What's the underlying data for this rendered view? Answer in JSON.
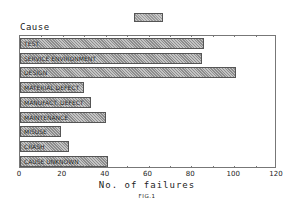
{
  "chart_data": {
    "type": "bar",
    "orientation": "horizontal",
    "title": "",
    "ylabel": "Cause",
    "xlabel": "No. of failures",
    "caption": "FIG.1",
    "xlim": [
      0,
      120
    ],
    "xticks": [
      0,
      20,
      40,
      60,
      80,
      100,
      120
    ],
    "grid": false,
    "legend": {
      "position": "top-center",
      "entries": [
        ""
      ]
    },
    "categories": [
      "TEST",
      "SERVICE ENVIRONMENT",
      "DESIGN",
      "MATERIAL DEFECT",
      "MANUFACT. DEFECT",
      "MAINTENANCE",
      "MISUSE",
      "CRASH",
      "CAUSE UNKNOWN"
    ],
    "values": [
      86,
      85,
      101,
      30,
      33,
      40,
      19,
      23,
      41
    ]
  },
  "labels": {
    "cause": "Cause",
    "xlabel": "No. of failures",
    "fig": "FIG.1",
    "ticks": [
      "0",
      "20",
      "40",
      "60",
      "80",
      "100",
      "120"
    ]
  }
}
